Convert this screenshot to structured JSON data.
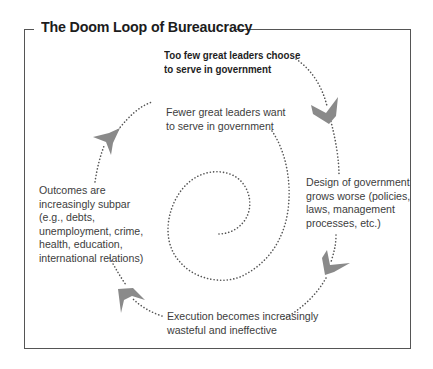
{
  "title": "The Doom Loop of Bureaucracy",
  "stages": [
    {
      "id": "leaders-choose",
      "lines": [
        "Too few great leaders choose",
        "to serve in government"
      ],
      "emphasis": "bold"
    },
    {
      "id": "design",
      "lines": [
        "Design of government",
        "grows worse (policies,",
        "laws, management",
        "processes, etc.)"
      ],
      "emphasis": "normal"
    },
    {
      "id": "execution",
      "lines": [
        "Execution becomes increasingly",
        "wasteful and ineffective"
      ],
      "emphasis": "normal"
    },
    {
      "id": "outcomes",
      "lines": [
        "Outcomes are",
        "increasingly subpar",
        "(e.g., debts,",
        "unemployment, crime,",
        "health, education,",
        "international relations)"
      ],
      "emphasis": "normal"
    },
    {
      "id": "leaders-want",
      "lines": [
        "Fewer great leaders want",
        "to serve in government"
      ],
      "emphasis": "normal"
    }
  ],
  "arrows": [
    {
      "name": "arrow-to-design",
      "direction": "down-right"
    },
    {
      "name": "arrow-to-execution",
      "direction": "down-left"
    },
    {
      "name": "arrow-to-outcomes",
      "direction": "up-left"
    },
    {
      "name": "arrow-to-leaders-want",
      "direction": "up-right"
    }
  ],
  "colors": {
    "arrow": "#8a8a8a",
    "dots": "#555555",
    "frame": "#555555",
    "text": "#3d3d3d",
    "title": "#1c1c1c"
  }
}
